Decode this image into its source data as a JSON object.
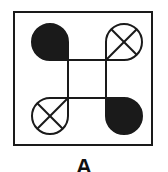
{
  "figure": {
    "label": "A",
    "stroke_color": "#1a1a1a",
    "fill_color": "#1a1a1a",
    "background": "#ffffff",
    "frame": {
      "x": 14,
      "y": 12,
      "width": 138,
      "height": 133
    },
    "inner_square": {
      "x1": 68,
      "y1": 60,
      "x2": 106,
      "y2": 98
    },
    "shapes": [
      {
        "position": "top-left",
        "type": "teardrop",
        "style": "filled",
        "point_corner": "bottom-right"
      },
      {
        "position": "top-right",
        "type": "teardrop",
        "style": "crossed-circle",
        "point_corner": "bottom-left"
      },
      {
        "position": "bottom-left",
        "type": "teardrop",
        "style": "crossed-circle",
        "point_corner": "top-right"
      },
      {
        "position": "bottom-right",
        "type": "teardrop",
        "style": "filled",
        "point_corner": "top-left"
      }
    ]
  }
}
